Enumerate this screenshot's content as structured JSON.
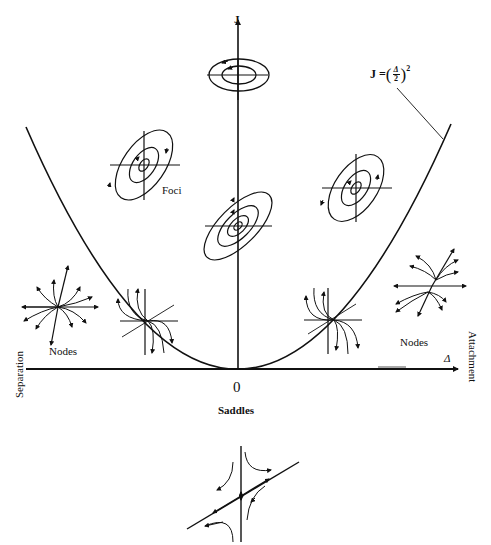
{
  "diagram": {
    "axes": {
      "vertical_label": "J",
      "horizontal_label": "Δ",
      "origin_label": "0",
      "left_side_label": "Separation",
      "right_side_label": "Attachment"
    },
    "curve": {
      "label_lhs": "J = ",
      "label_num": "Δ",
      "label_den": "2",
      "label_exp": "2",
      "equation": "J = (Δ/2)^2"
    },
    "regions": {
      "foci_label": "Foci",
      "nodes_left_label": "Nodes",
      "nodes_right_label": "Nodes",
      "saddles_label": "Saddles"
    },
    "insets": [
      {
        "type": "center",
        "location": "J-axis top"
      },
      {
        "type": "focus",
        "location": "upper-left inside parabola"
      },
      {
        "type": "focus",
        "location": "center on J-axis"
      },
      {
        "type": "focus",
        "location": "upper-right inside parabola"
      },
      {
        "type": "node",
        "location": "left outside parabola"
      },
      {
        "type": "degenerate-node",
        "location": "on left branch of parabola"
      },
      {
        "type": "degenerate-node",
        "location": "on right branch of parabola"
      },
      {
        "type": "node",
        "location": "right outside parabola"
      },
      {
        "type": "saddle",
        "location": "below origin"
      }
    ],
    "colors": {
      "ink": "#111111",
      "background": "#ffffff"
    }
  }
}
